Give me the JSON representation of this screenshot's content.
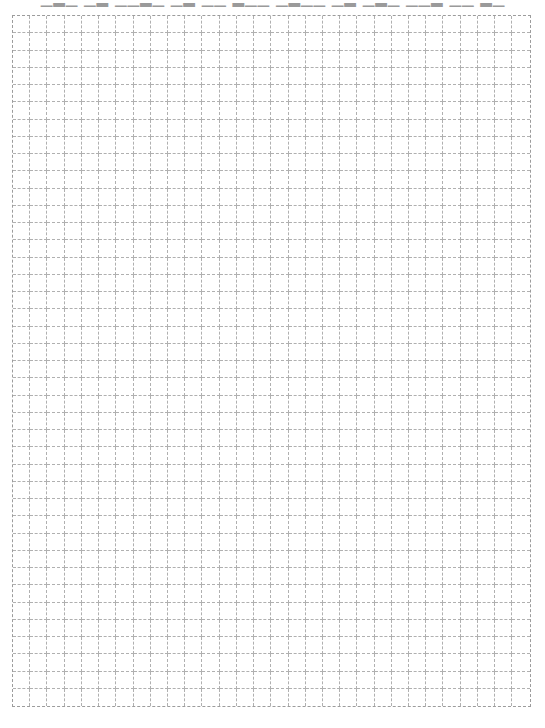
{
  "document": {
    "type": "grid-paper",
    "heading_clipped_text": "▁▂▁ ▁▂ ▁▁▂▁ ▁▂ ▁▁ ▂▁▁ ▁▂▁▁ ▁▂ ▁▂▁ ▁▁▂ ▁▁ ▂▁",
    "heading_visible": "bottom portion only (text clipped at top edge of page)"
  },
  "grid": {
    "columns": 30,
    "rows": 40,
    "cell_size_px": 17.3,
    "line_style": "dashed",
    "line_color": "#b0b0b0",
    "border_color": "#9c9c9c",
    "background": "#ffffff"
  }
}
